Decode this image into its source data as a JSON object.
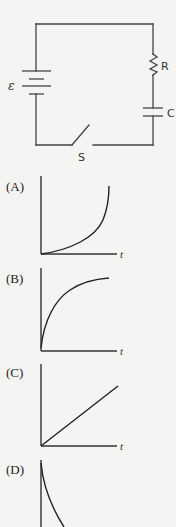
{
  "circuit": {
    "emf_label": "ε",
    "resistor_label": "R",
    "capacitor_label": "C",
    "switch_label": "S",
    "switch_state": "open"
  },
  "options": [
    {
      "label": "(A)",
      "axis_label": "t",
      "curve": "exponential-growth (concave up, starts at origin)"
    },
    {
      "label": "(B)",
      "axis_label": "t",
      "curve": "saturating growth (concave down, approaches asymptote)"
    },
    {
      "label": "(C)",
      "axis_label": "t",
      "curve": "linear increase from origin"
    },
    {
      "label": "(D)",
      "axis_label": "t",
      "curve": "exponential decay from maximum"
    }
  ]
}
